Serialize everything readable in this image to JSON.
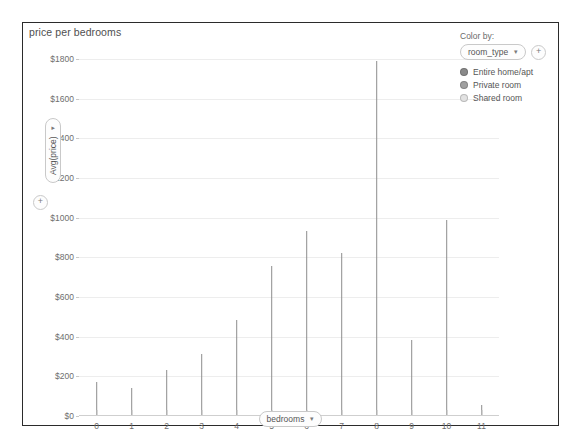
{
  "chart_title": "price per bedrooms",
  "x_axis_pill": {
    "label": "bedrooms",
    "caret": "▾"
  },
  "y_axis_pill": {
    "label": "Avg(price)",
    "caret": "▾",
    "plus_icon": "+"
  },
  "legend": {
    "title": "Color by:",
    "field": "room_type",
    "caret": "▾",
    "plus_icon": "+",
    "items": [
      {
        "label": "Entire home/apt",
        "color": "#8a8a8a"
      },
      {
        "label": "Private room",
        "color": "#a0a0a0"
      },
      {
        "label": "Shared room",
        "color": "#e2e2e2"
      }
    ]
  },
  "chart_data": {
    "type": "bar",
    "title": "price per bedrooms",
    "xlabel": "bedrooms",
    "ylabel": "Avg(price)",
    "categories": [
      "0",
      "1",
      "2",
      "3",
      "4",
      "5",
      "6",
      "7",
      "8",
      "9",
      "10",
      "11"
    ],
    "values": [
      170,
      140,
      230,
      315,
      485,
      755,
      935,
      820,
      1790,
      385,
      990,
      55
    ],
    "ylim": [
      0,
      1800
    ],
    "ytick_values": [
      0,
      200,
      400,
      600,
      800,
      1000,
      1200,
      1400,
      1600,
      1800
    ],
    "ytick_labels": [
      "$0",
      "$200",
      "$400",
      "$600",
      "$800",
      "$1000",
      "$1200",
      "$1400",
      "$1600",
      "$1800"
    ],
    "grid": true,
    "legend_position": "top-right",
    "bar_color": "#8d8d8d",
    "series": [
      {
        "name": "Avg(price)",
        "values": [
          170,
          140,
          230,
          315,
          485,
          755,
          935,
          820,
          1790,
          385,
          990,
          55
        ]
      }
    ]
  }
}
